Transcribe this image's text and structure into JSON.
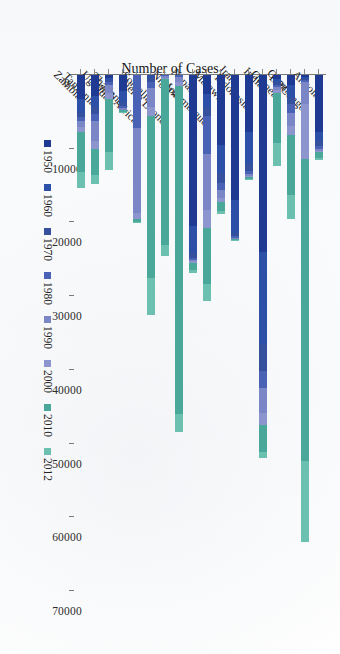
{
  "chart_data": {
    "type": "bar",
    "orientation": "horizontal-stacked",
    "title": "",
    "xlabel": "Number of Cases",
    "ylabel": "",
    "xlim": [
      0,
      70000
    ],
    "xticks": [
      0,
      10000,
      20000,
      30000,
      40000,
      50000,
      60000,
      70000
    ],
    "xtick_labels": [
      "0",
      "10000",
      "20000",
      "30000",
      "40000",
      "50000",
      "60000",
      "70000"
    ],
    "grid": false,
    "legend_position": "bottom",
    "categories": [
      "Angola",
      "DRCongo",
      "Ghana",
      "Guinea",
      "India",
      "Indonesia",
      "Iran",
      "Malawi",
      "Mozambique",
      "Nepal",
      "Nigeria",
      "Sierra Leone",
      "Somalia",
      "South Africa",
      "Thailand",
      "Uganda",
      "Tanzania",
      "Zambia"
    ],
    "series": [
      {
        "name": "1950",
        "color": "#1f3a93",
        "values": [
          7800,
          300,
          1400,
          600,
          24000,
          7700,
          17000,
          9500,
          2600,
          20500,
          0,
          0,
          0,
          0,
          2200,
          400,
          2900,
          3300
        ]
      },
      {
        "name": "1960",
        "color": "#2c4fa8",
        "values": [
          1200,
          200,
          1700,
          400,
          12500,
          4300,
          4500,
          3800,
          1800,
          3600,
          0,
          0,
          400,
          0,
          1400,
          300,
          1500,
          1800
        ]
      },
      {
        "name": "1970",
        "color": "#35519e",
        "values": [
          600,
          200,
          900,
          300,
          3600,
          1000,
          400,
          1400,
          1100,
          700,
          0,
          0,
          500,
          0,
          600,
          200,
          900,
          600
        ]
      },
      {
        "name": "1980",
        "color": "#4a62b5",
        "values": [
          400,
          300,
          1100,
          300,
          2300,
          400,
          200,
          900,
          5200,
          300,
          300,
          200,
          900,
          7200,
          300,
          500,
          1000,
          500
        ]
      },
      {
        "name": "1990",
        "color": "#7b86c6",
        "values": [
          300,
          2900,
          1800,
          500,
          3400,
          300,
          100,
          1100,
          7600,
          200,
          700,
          200,
          2600,
          11500,
          200,
          1000,
          2600,
          900
        ]
      },
      {
        "name": "2000",
        "color": "#8d95cf",
        "values": [
          200,
          7500,
          1200,
          300,
          1700,
          200,
          100,
          500,
          2400,
          200,
          500,
          200,
          1200,
          800,
          100,
          800,
          1100,
          700
        ]
      },
      {
        "name": "2010",
        "color": "#4aa89a",
        "values": [
          700,
          41000,
          8200,
          6800,
          3700,
          200,
          100,
          1200,
          7700,
          900,
          44500,
          22500,
          22000,
          400,
          200,
          7300,
          3600,
          5400
        ]
      },
      {
        "name": "2012",
        "color": "#6cc0b0",
        "values": [
          400,
          11000,
          3300,
          3200,
          700,
          100,
          100,
          500,
          2300,
          400,
          2400,
          1500,
          5000,
          200,
          100,
          2400,
          1200,
          2200
        ]
      }
    ]
  },
  "axis": {
    "y_title": "Number of Cases"
  }
}
